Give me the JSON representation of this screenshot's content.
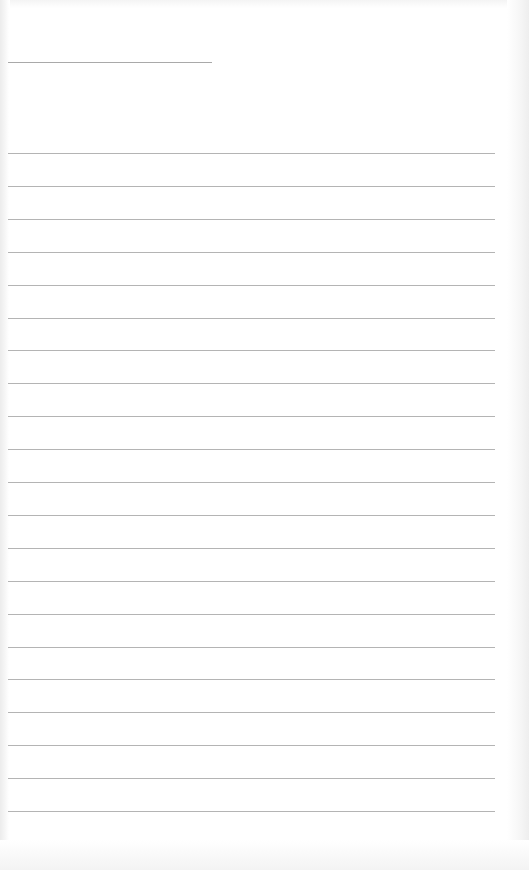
{
  "document": {
    "type": "blank lined notebook page",
    "header_line": {
      "visible": true
    },
    "ruled_lines_count": 21,
    "lines": [
      "",
      "",
      "",
      "",
      "",
      "",
      "",
      "",
      "",
      "",
      "",
      "",
      "",
      "",
      "",
      "",
      "",
      "",
      "",
      "",
      ""
    ],
    "colors": {
      "paper": "#ffffff",
      "rule": "#b4b4b4",
      "header_rule": "#a9a9a9"
    }
  }
}
